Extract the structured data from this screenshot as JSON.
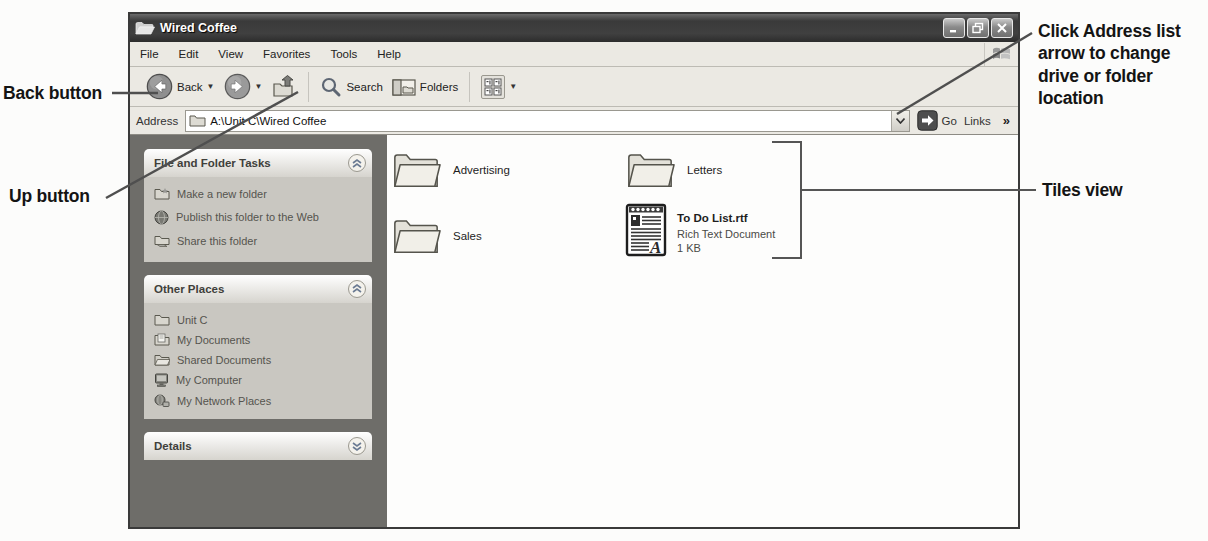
{
  "colors": {
    "titlebar": "#3a3a3a",
    "chrome": "#ebe9e3",
    "sidebar": "#6e6d69",
    "panel_body": "#c9c7c1",
    "content_bg": "#fdfdfc",
    "annotation_line": "#4f4f4f"
  },
  "annotations": {
    "back_button": "Back button",
    "up_button": "Up button",
    "address_note": "Click Address list arrow to change drive or folder location",
    "tiles_view": "Tiles view"
  },
  "window": {
    "title": "Wired Coffee",
    "controls": {
      "minimize": "minimize",
      "restore": "restore",
      "close": "close"
    },
    "menu": [
      "File",
      "Edit",
      "View",
      "Favorites",
      "Tools",
      "Help"
    ],
    "toolbar": {
      "back_label": "Back",
      "search_label": "Search",
      "folders_label": "Folders"
    },
    "address": {
      "label": "Address",
      "value": "A:\\Unit C\\Wired Coffee",
      "go_label": "Go",
      "links_label": "Links",
      "overflow_chevron": "»"
    },
    "sidebar": {
      "tasks_panel": {
        "title": "File and Folder Tasks",
        "items": [
          {
            "label": "Make a new folder"
          },
          {
            "label": "Publish this folder to the Web"
          },
          {
            "label": "Share this folder"
          }
        ]
      },
      "places_panel": {
        "title": "Other Places",
        "items": [
          {
            "label": "Unit C"
          },
          {
            "label": "My Documents"
          },
          {
            "label": "Shared Documents"
          },
          {
            "label": "My Computer"
          },
          {
            "label": "My Network Places"
          }
        ]
      },
      "details_panel": {
        "title": "Details"
      }
    },
    "files": {
      "advertising": {
        "name": "Advertising"
      },
      "letters": {
        "name": "Letters"
      },
      "sales": {
        "name": "Sales"
      },
      "todo": {
        "name": "To Do List.rtf",
        "type": "Rich Text Document",
        "size": "1 KB"
      }
    }
  }
}
